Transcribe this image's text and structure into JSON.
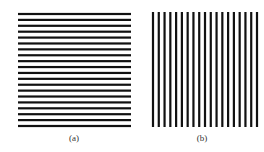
{
  "figure": {
    "panels": [
      {
        "id": "a",
        "caption": "(a)",
        "orientation": "horizontal",
        "line_count": 20,
        "line_color": "#111111"
      },
      {
        "id": "b",
        "caption": "(b)",
        "orientation": "vertical",
        "line_count": 19,
        "line_color": "#111111"
      }
    ]
  }
}
